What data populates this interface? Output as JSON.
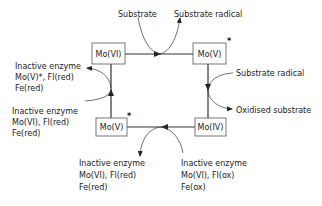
{
  "diagram": {
    "nodes": {
      "top_left": {
        "label": "Mo(VI)",
        "star": ""
      },
      "top_right": {
        "label": "Mo(V)",
        "star": "*"
      },
      "bottom_right": {
        "label": "Mo(IV)",
        "star": ""
      },
      "bottom_left": {
        "label": "Mo(V)",
        "star": "*"
      }
    },
    "top": {
      "input": "Substrate",
      "output": "Substrate radical"
    },
    "right": {
      "input": "Substrate radical",
      "output": "Oxidised substrate"
    },
    "left_upper": {
      "line1": "Inactive enzyme",
      "line2": "Mo(V)*, Fl(red)",
      "line3": "Fe(red)"
    },
    "left_lower": {
      "line1": "Inactive enzyme",
      "line2": "Mo(VI), Fl(red)",
      "line3": "Fe(red)"
    },
    "bottom_left_out": {
      "line1": "Inactive enzyme",
      "line2": "Mo(VI), Fl(red)",
      "line3": "Fe(red)"
    },
    "bottom_right_in": {
      "line1": "Inactive enzyme",
      "line2": "Mo(VI), Fl(ox)",
      "line3": "Fe(ox)"
    }
  }
}
